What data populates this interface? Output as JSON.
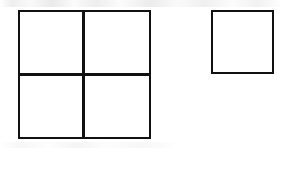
{
  "figure": {
    "type": "geometric-line-diagram",
    "background_color": "#ffffff",
    "stroke_color": "#111111",
    "fill_color": "#ffffff",
    "stroke_width": 2,
    "canvas": {
      "width": 283,
      "height": 180
    },
    "shapes": [
      {
        "name": "large-square",
        "label": "Large square divided into four equal parts",
        "x": 19,
        "y": 11,
        "width": 131,
        "height": 127,
        "divisions": {
          "rows": 2,
          "columns": 2,
          "cell_count": 4,
          "vertical_divider_x": 83,
          "horizontal_divider_y": 74
        },
        "cells": [
          {
            "name": "cell-top-left",
            "x": 19,
            "y": 11,
            "width": 64,
            "height": 63
          },
          {
            "name": "cell-top-right",
            "x": 83,
            "y": 11,
            "width": 67,
            "height": 63
          },
          {
            "name": "cell-bottom-left",
            "x": 19,
            "y": 74,
            "width": 64,
            "height": 64
          },
          {
            "name": "cell-bottom-right",
            "x": 83,
            "y": 74,
            "width": 67,
            "height": 64
          }
        ]
      },
      {
        "name": "small-square",
        "label": "Small undivided square",
        "x": 212,
        "y": 11,
        "width": 61,
        "height": 62,
        "divisions": {
          "rows": 1,
          "columns": 1,
          "cell_count": 1
        },
        "cells": [
          {
            "name": "cell-single",
            "x": 212,
            "y": 11,
            "width": 61,
            "height": 62
          }
        ]
      }
    ]
  }
}
